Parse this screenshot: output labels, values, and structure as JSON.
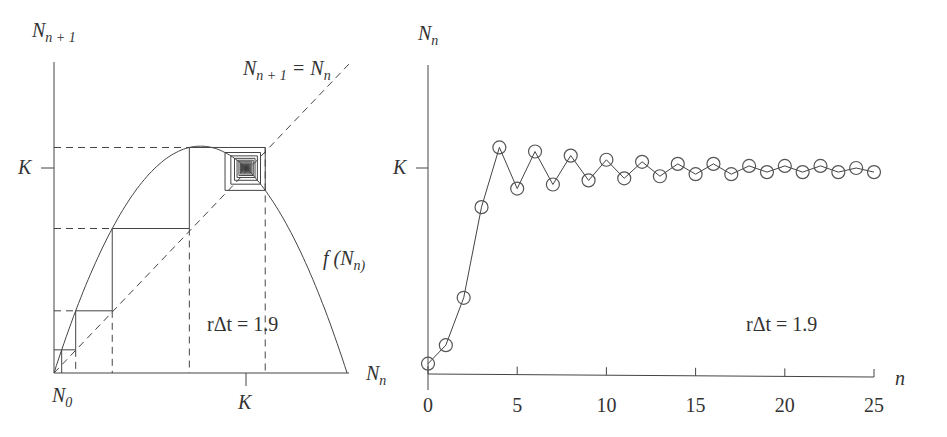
{
  "chart_data": [
    {
      "type": "line",
      "name": "cobweb-diagram",
      "title": "",
      "xlabel": "N_n",
      "ylabel": "N_{n+1}",
      "x_ticks": [
        {
          "label": "N_0",
          "value": 0.04
        },
        {
          "label": "K",
          "value": 1.0
        }
      ],
      "y_ticks": [
        {
          "label": "K",
          "value": 1.0
        }
      ],
      "annotations": [
        "N_{n+1} = N_n",
        "f(N_n)",
        "rΔt = 1.9"
      ],
      "parameter": {
        "r_dt": 1.9
      },
      "curve": "f(N_n) = N_n + rΔt·N_n(1 − N_n/K)",
      "identity_line": "N_{n+1} = N_n (dashed)",
      "cobweb_x": [
        0.04,
        0.14,
        0.37,
        0.81,
        1.1,
        0.9,
        1.08,
        0.92,
        1.06,
        0.94,
        1.04
      ],
      "xlim": [
        0,
        1.53
      ],
      "ylim": [
        0,
        1.6
      ],
      "grid": false,
      "legend": "none"
    },
    {
      "type": "line",
      "name": "time-series",
      "title": "",
      "xlabel": "n",
      "ylabel": "N_n",
      "x": [
        0,
        1,
        2,
        3,
        4,
        5,
        6,
        7,
        8,
        9,
        10,
        11,
        12,
        13,
        14,
        15,
        16,
        17,
        18,
        19,
        20,
        21,
        22,
        23,
        24,
        25
      ],
      "values": [
        0.05,
        0.14,
        0.37,
        0.81,
        1.1,
        0.9,
        1.08,
        0.92,
        1.06,
        0.94,
        1.04,
        0.95,
        1.03,
        0.96,
        1.02,
        0.97,
        1.02,
        0.97,
        1.01,
        0.98,
        1.01,
        0.98,
        1.01,
        0.98,
        1.0,
        0.98
      ],
      "markers": "open-circle",
      "x_ticks": [
        "0",
        "5",
        "10",
        "15",
        "20",
        "25"
      ],
      "y_ticks": [
        {
          "label": "K",
          "value": 1.0
        }
      ],
      "annotations": [
        "rΔt = 1.9"
      ],
      "xlim": [
        0,
        25
      ],
      "ylim": [
        0,
        1.6
      ],
      "grid": false,
      "legend": "none"
    }
  ],
  "left": {
    "y_axis_label_main": "N",
    "y_axis_label_sub": "n + 1",
    "x_axis_label_main": "N",
    "x_axis_label_sub": "n",
    "k_y_label": "K",
    "k_x_label": "K",
    "n0_main": "N",
    "n0_sub": "0",
    "identity_main": "N",
    "identity_sub1": "n + 1",
    "identity_eq": " = N",
    "identity_sub2": "n",
    "f_label_pre": "f (N",
    "f_label_sub": "n)",
    "param_label": "rΔt = 1.9"
  },
  "right": {
    "y_axis_label_main": "N",
    "y_axis_label_sub": "n",
    "x_axis_label": "n",
    "k_y_label": "K",
    "tick_labels": [
      "0",
      "5",
      "10",
      "15",
      "20",
      "25"
    ],
    "param_label": "rΔt = 1.9"
  },
  "colors": {
    "ink": "#333333",
    "background": "#ffffff"
  }
}
